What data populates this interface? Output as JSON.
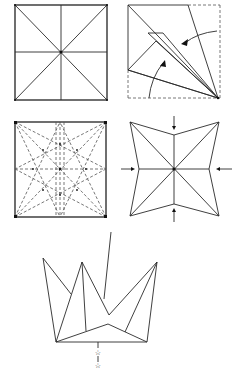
{
  "steps": [
    {
      "id": 1,
      "label": "Square with diagonal and middle creases"
    },
    {
      "id": 2,
      "label": "Kite folds toward corner with arrows"
    },
    {
      "id": 3,
      "label": "Square with dashed crease pattern"
    },
    {
      "id": 4,
      "label": "Four-pointed star collapse with inward arrows"
    },
    {
      "id": 5,
      "label": "Crown-like folded form with attached stick"
    }
  ],
  "colors": {
    "line": "#2a2a2a",
    "background": "#ffffff"
  }
}
